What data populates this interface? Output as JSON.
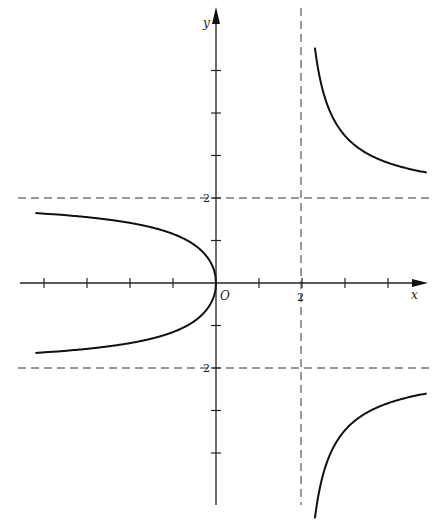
{
  "chart_data": {
    "type": "line",
    "title": "",
    "equation": "y^2 = 4x/(x-2)",
    "xlabel": "x",
    "ylabel": "y",
    "origin_label": "O",
    "xlim": [
      -4.6,
      4.9
    ],
    "ylim": [
      -5.3,
      6.6
    ],
    "x_ticks": [
      -4,
      -3,
      -2,
      -1,
      1,
      2,
      3,
      4
    ],
    "y_ticks": [
      -4,
      -3,
      -2,
      -1,
      1,
      2,
      3,
      4,
      5
    ],
    "tick_labels": {
      "x": [
        {
          "value": 2,
          "label": "2"
        }
      ],
      "y": [
        {
          "value": 2,
          "label": "2"
        },
        {
          "value": -2,
          "label": "2"
        }
      ]
    },
    "asymptotes": [
      {
        "type": "vertical",
        "x": 2,
        "style": "dashed"
      },
      {
        "type": "horizontal",
        "y": 2,
        "style": "dashed"
      },
      {
        "type": "horizontal",
        "y": -2,
        "style": "dashed"
      }
    ],
    "series": [
      {
        "name": "left-branch",
        "x_range": [
          -4.2,
          0
        ],
        "description": "closed curve through origin, approaching y=±2 as x→-∞"
      },
      {
        "name": "upper-right-branch",
        "x_range": [
          2.3,
          4.9
        ],
        "description": "y>0 for x>2, decreasing toward y=2"
      },
      {
        "name": "lower-right-branch",
        "x_range": [
          2.3,
          4.9
        ],
        "description": "y<0 for x>2, increasing toward y=-2"
      }
    ],
    "grid": false,
    "legend": null
  },
  "labels": {
    "x_axis": "x",
    "y_axis": "y",
    "origin": "O",
    "x_tick_2": "2",
    "y_tick_2": "2",
    "y_tick_neg2": "2"
  }
}
